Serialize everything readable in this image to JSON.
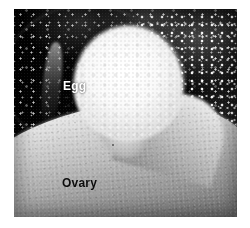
{
  "figure": {
    "kind": "micrograph",
    "modality": "grayscale light micrograph",
    "background_color": "#ffffff",
    "plate": {
      "dark_field_color": "#080808",
      "egg_highlight_color": "#fbfbfb",
      "ovary_tone_color": "#b4b4b4",
      "ovary_shadow_color": "#3d3d3d"
    },
    "labels": [
      {
        "id": "egg",
        "text": "Egg",
        "color": "#fdfdfd",
        "placement": "upper-left of bright spherical body"
      },
      {
        "id": "ovary",
        "text": "Ovary",
        "color": "#111111",
        "placement": "lower-left on pale tissue surface"
      }
    ],
    "regions": [
      {
        "id": "egg",
        "name": "egg",
        "appearance": "bright rounded mass, upper centre"
      },
      {
        "id": "ovary",
        "name": "ovary",
        "appearance": "pale grey tissue sweeping across lower half"
      },
      {
        "id": "background",
        "name": "dark field background",
        "appearance": "near-black with bright speckles"
      },
      {
        "id": "follicles",
        "name": "follicles",
        "appearance": "faint circular outlines, lower right"
      }
    ]
  }
}
